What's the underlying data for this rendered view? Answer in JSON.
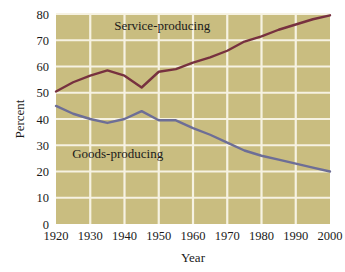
{
  "chart_data": {
    "type": "line",
    "title": "",
    "xlabel": "Year",
    "ylabel": "Percent",
    "xlim": [
      1920,
      2000
    ],
    "ylim": [
      0,
      80
    ],
    "xticks": [
      1920,
      1930,
      1940,
      1950,
      1960,
      1970,
      1980,
      1990,
      2000
    ],
    "yticks": [
      0,
      10,
      20,
      30,
      40,
      50,
      60,
      70,
      80
    ],
    "grid": true,
    "legend_position": "inline-annotation",
    "plot_background": "#c9bd80",
    "gridline_color": "#f6f2e2",
    "series": [
      {
        "name": "Service-producing",
        "color": "#77313f",
        "label_x": 1951,
        "label_y": 74,
        "x": [
          1920,
          1925,
          1930,
          1935,
          1940,
          1945,
          1950,
          1955,
          1960,
          1965,
          1970,
          1975,
          1980,
          1985,
          1990,
          1995,
          2000
        ],
        "values": [
          50.5,
          54,
          56.5,
          58.5,
          56.5,
          52,
          58,
          59,
          61.5,
          63.5,
          66,
          69.5,
          71.5,
          74,
          76,
          78,
          79.5
        ]
      },
      {
        "name": "Goods-producing",
        "color": "#6d6e96",
        "label_x": 1938,
        "label_y": 25,
        "x": [
          1920,
          1925,
          1930,
          1935,
          1940,
          1945,
          1950,
          1955,
          1960,
          1965,
          1970,
          1975,
          1980,
          1985,
          1990,
          1995,
          2000
        ],
        "values": [
          45,
          42,
          40,
          38.5,
          40,
          43,
          39.5,
          39.5,
          36.5,
          34,
          31,
          28,
          26,
          24.5,
          23,
          21.5,
          20
        ]
      }
    ]
  },
  "axes": {
    "y_title": "Percent",
    "x_title": "Year",
    "y_tick_labels": [
      "80",
      "70",
      "60",
      "50",
      "40",
      "30",
      "20",
      "10",
      "0"
    ],
    "x_tick_labels": [
      "1920",
      "1930",
      "1940",
      "1950",
      "1960",
      "1970",
      "1980",
      "1990",
      "2000"
    ]
  },
  "annotations": {
    "service_label": "Service-producing",
    "goods_label": "Goods-producing"
  }
}
